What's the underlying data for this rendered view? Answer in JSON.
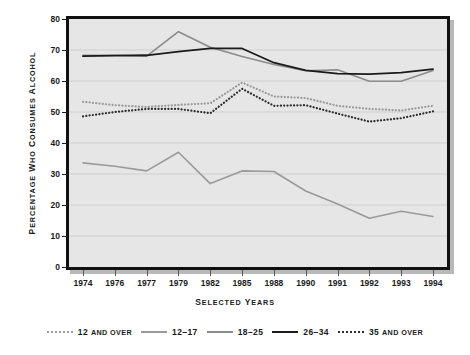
{
  "chart_data": {
    "type": "line",
    "title": "",
    "xlabel": "Selected Years",
    "ylabel": "Percentage Who Consumes Alcohol",
    "categories": [
      "1974",
      "1976",
      "1977",
      "1979",
      "1982",
      "1985",
      "1988",
      "1990",
      "1991",
      "1992",
      "1993",
      "1994"
    ],
    "ylim": [
      0,
      80
    ],
    "yticks": [
      0,
      10,
      20,
      30,
      40,
      50,
      60,
      70,
      80
    ],
    "grid": true,
    "legend_position": "bottom",
    "series": [
      {
        "name": "12 and over",
        "style": "dotted",
        "color": "#9a9a9a",
        "values": [
          53.3,
          52.2,
          51.6,
          52.3,
          52.8,
          59.5,
          55.0,
          54.5,
          52.0,
          51.0,
          50.5,
          52.0
        ]
      },
      {
        "name": "12-17",
        "style": "solid",
        "color": "#9a9a9a",
        "values": [
          33.6,
          32.5,
          31.0,
          37.0,
          26.9,
          31.0,
          30.8,
          24.5,
          20.3,
          15.7,
          18.0,
          16.3
        ]
      },
      {
        "name": "18-25",
        "style": "solid",
        "color": "#8c8c8c",
        "values": [
          68.3,
          68.3,
          68.0,
          75.9,
          70.9,
          67.9,
          65.3,
          63.3,
          63.6,
          59.9,
          59.9,
          63.4
        ]
      },
      {
        "name": "26-34",
        "style": "solid",
        "color": "#1a1a1a",
        "values": [
          68.0,
          68.2,
          68.3,
          69.5,
          70.5,
          70.5,
          65.9,
          63.4,
          62.4,
          62.2,
          62.7,
          63.8
        ]
      },
      {
        "name": "35 and over",
        "style": "dotted",
        "color": "#2b2b2b",
        "values": [
          48.6,
          50.0,
          51.0,
          51.0,
          49.6,
          57.5,
          52.0,
          52.2,
          49.5,
          46.9,
          48.0,
          50.2
        ]
      }
    ]
  },
  "legend": {
    "items": [
      {
        "label_main": "12",
        "label_small": "and over",
        "full": "12 and over"
      },
      {
        "label_main": "12–17",
        "label_small": "",
        "full": "12–17"
      },
      {
        "label_main": "18–25",
        "label_small": "",
        "full": "18–25"
      },
      {
        "label_main": "26–34",
        "label_small": "",
        "full": "26–34"
      },
      {
        "label_main": "35",
        "label_small": "and over",
        "full": "35 and over"
      }
    ]
  },
  "axis_titles": {
    "x_main": "S",
    "x_rest": "elected ",
    "x_cap2": "Y",
    "x_rest2": "ears",
    "x_full": "Selected Years",
    "y_full": "Percentage Who Consumes Alcohol"
  }
}
